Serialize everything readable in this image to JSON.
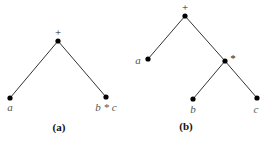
{
  "figures": [
    {
      "caption": "(a)",
      "root": {
        "label": "+"
      },
      "leaves": [
        {
          "label": "a"
        },
        {
          "label": "b * c"
        }
      ]
    },
    {
      "caption": "(b)",
      "root": {
        "label": "+"
      },
      "left_leaf": {
        "label": "a"
      },
      "inner": {
        "label": "*",
        "children": [
          {
            "label": "b"
          },
          {
            "label": "c"
          }
        ]
      }
    }
  ]
}
